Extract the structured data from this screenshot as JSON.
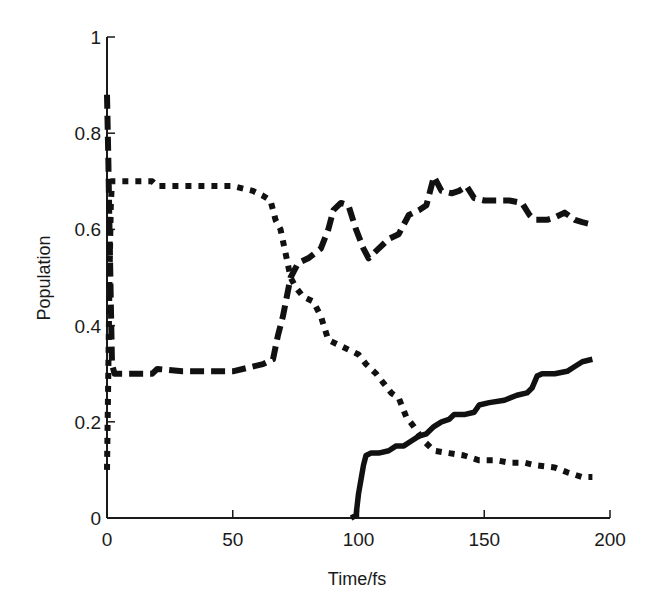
{
  "chart_data": {
    "type": "line",
    "title": "",
    "xlabel": "Time/fs",
    "ylabel": "Population",
    "xlim": [
      0,
      200
    ],
    "ylim": [
      0,
      1
    ],
    "xticks": [
      0,
      50,
      100,
      150,
      200
    ],
    "yticks": [
      0,
      0.2,
      0.4,
      0.6,
      0.8,
      1
    ],
    "xtick_labels": [
      "0",
      "50",
      "100",
      "150",
      "200"
    ],
    "ytick_labels": [
      "0",
      "0.2",
      "0.4",
      "0.6",
      "0.8",
      "1"
    ],
    "grid": false,
    "legend": null,
    "series": [
      {
        "name": "dashed",
        "style": "dashed",
        "color": "#111111",
        "x": [
          0,
          0.5,
          1,
          1.5,
          2,
          3,
          10,
          18,
          20,
          30,
          50,
          62,
          66,
          68,
          70,
          73,
          76,
          80,
          85,
          88,
          90,
          93,
          96,
          99,
          102,
          104,
          108,
          112,
          116,
          120,
          124,
          127,
          130,
          133,
          137,
          140,
          143,
          146,
          150,
          160,
          165,
          168,
          170,
          175,
          178,
          182,
          186,
          189,
          193
        ],
        "y": [
          0.88,
          0.75,
          0.6,
          0.45,
          0.32,
          0.3,
          0.3,
          0.3,
          0.31,
          0.305,
          0.305,
          0.32,
          0.33,
          0.38,
          0.42,
          0.5,
          0.53,
          0.54,
          0.56,
          0.6,
          0.64,
          0.655,
          0.65,
          0.6,
          0.56,
          0.54,
          0.56,
          0.58,
          0.59,
          0.63,
          0.64,
          0.65,
          0.71,
          0.68,
          0.675,
          0.68,
          0.69,
          0.665,
          0.66,
          0.66,
          0.655,
          0.63,
          0.62,
          0.62,
          0.625,
          0.635,
          0.62,
          0.615,
          0.61
        ]
      },
      {
        "name": "dotted",
        "style": "dotted",
        "color": "#111111",
        "x": [
          0,
          0.5,
          1,
          1.5,
          2,
          5,
          15,
          18,
          20,
          30,
          50,
          58,
          62,
          65,
          67,
          69,
          71,
          73,
          75,
          78,
          82,
          85,
          88,
          92,
          96,
          100,
          103,
          107,
          110,
          113,
          116,
          119,
          122,
          126,
          130,
          136,
          142,
          148,
          155,
          160,
          166,
          170,
          178,
          183,
          186,
          189,
          193
        ],
        "y": [
          0.1,
          0.3,
          0.5,
          0.65,
          0.7,
          0.7,
          0.7,
          0.7,
          0.69,
          0.69,
          0.69,
          0.68,
          0.67,
          0.66,
          0.62,
          0.6,
          0.55,
          0.5,
          0.48,
          0.46,
          0.45,
          0.42,
          0.37,
          0.36,
          0.35,
          0.34,
          0.32,
          0.3,
          0.28,
          0.26,
          0.25,
          0.21,
          0.19,
          0.16,
          0.14,
          0.135,
          0.13,
          0.12,
          0.12,
          0.115,
          0.115,
          0.11,
          0.105,
          0.095,
          0.09,
          0.085,
          0.085
        ]
      },
      {
        "name": "solid",
        "style": "solid",
        "color": "#111111",
        "x": [
          97,
          99,
          100,
          101,
          102,
          103,
          105,
          108,
          112,
          115,
          118,
          121,
          124,
          127,
          130,
          133,
          136,
          138,
          142,
          146,
          148,
          152,
          158,
          163,
          167,
          169,
          171,
          173,
          178,
          183,
          186,
          189,
          193
        ],
        "y": [
          0,
          0.005,
          0.05,
          0.08,
          0.11,
          0.13,
          0.135,
          0.135,
          0.14,
          0.15,
          0.15,
          0.16,
          0.17,
          0.175,
          0.19,
          0.2,
          0.205,
          0.215,
          0.215,
          0.22,
          0.235,
          0.24,
          0.245,
          0.255,
          0.26,
          0.27,
          0.295,
          0.3,
          0.3,
          0.305,
          0.315,
          0.325,
          0.33
        ]
      }
    ]
  }
}
